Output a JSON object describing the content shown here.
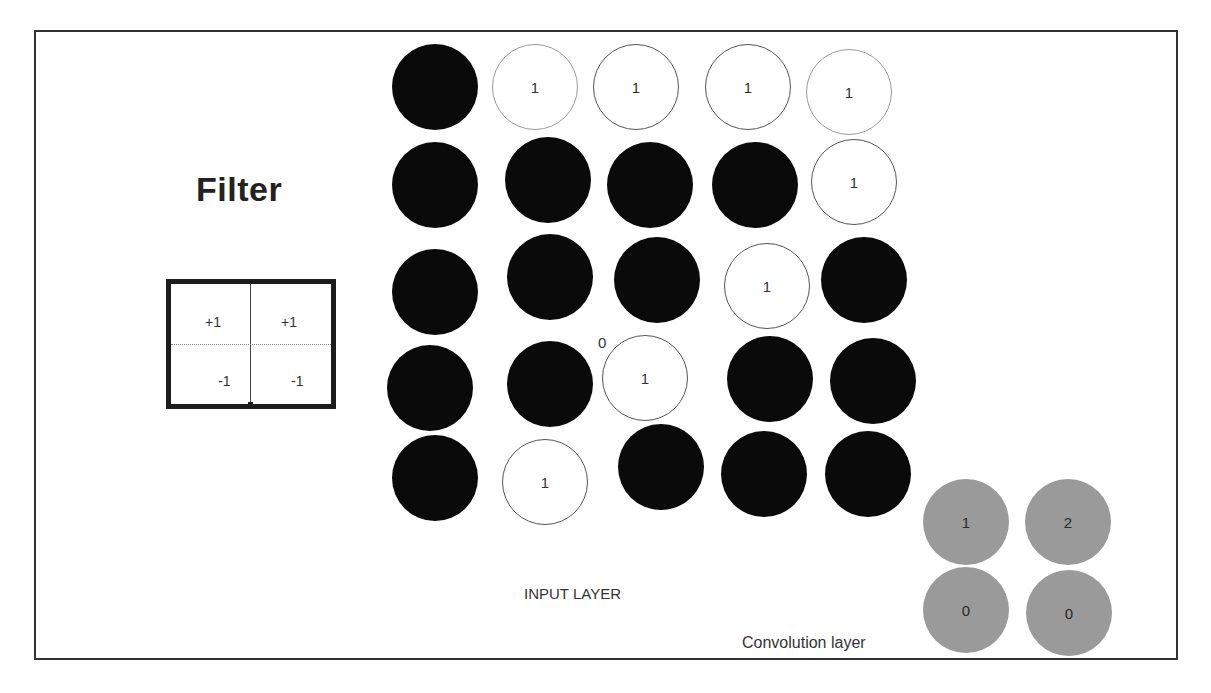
{
  "filter": {
    "title": "Filter",
    "cells": [
      {
        "row": 0,
        "col": 0,
        "value": "+1"
      },
      {
        "row": 0,
        "col": 1,
        "value": "+1"
      },
      {
        "row": 1,
        "col": 0,
        "value": "-1"
      },
      {
        "row": 1,
        "col": 1,
        "value": "-1"
      }
    ]
  },
  "input_layer": {
    "label": "INPUT LAYER",
    "grid": [
      [
        "",
        "1",
        "1",
        "1",
        "1"
      ],
      [
        "",
        "",
        "",
        "",
        "1"
      ],
      [
        "",
        "",
        "",
        "1",
        ""
      ],
      [
        "",
        "",
        "1",
        "",
        ""
      ],
      [
        "",
        "1",
        "",
        "",
        ""
      ]
    ],
    "annotation": "0"
  },
  "convolution_layer": {
    "label": "Convolution layer",
    "grid": [
      [
        "1",
        "2"
      ],
      [
        "0",
        "0"
      ]
    ]
  },
  "colors": {
    "filled": "#0a0a0a",
    "empty": "#ffffff",
    "conv": "#9a9a9a"
  }
}
